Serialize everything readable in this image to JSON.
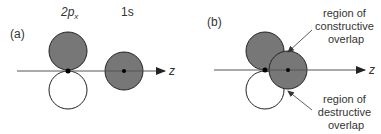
{
  "panel_a": {
    "label": "(a)",
    "orbital_p_label": "2p",
    "orbital_p_subscript": "x",
    "orbital_s_label": "1s",
    "axis_label": "z"
  },
  "panel_b": {
    "label": "(b)",
    "axis_label": "z",
    "annotation_constructive": [
      "region of",
      "constructive",
      "overlap"
    ],
    "annotation_destructive": [
      "region of",
      "destructive",
      "overlap"
    ]
  },
  "colors": {
    "shaded_lobe": "#777777",
    "empty_lobe": "#ffffff",
    "outline": "#222222",
    "axis": "#555555"
  }
}
